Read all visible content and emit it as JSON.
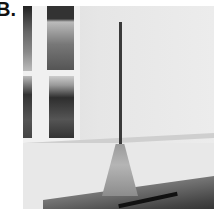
{
  "figure": {
    "panel_label": "B.",
    "photo": {
      "subject": "broom leaning in corner of room beside window",
      "style": "grayscale photograph",
      "elements": [
        "window",
        "wall",
        "broom",
        "floor-rug"
      ]
    }
  }
}
